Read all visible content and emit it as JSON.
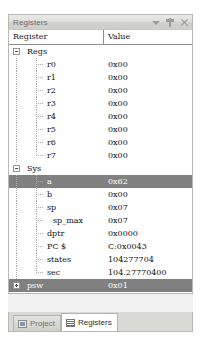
{
  "panel": {
    "title": "Registers",
    "title_icons": [
      {
        "name": "chevron-down-icon",
        "glyph": "caret"
      },
      {
        "name": "auto-hide-pin-icon",
        "glyph": "pin"
      },
      {
        "name": "close-icon",
        "glyph": "close"
      }
    ]
  },
  "grid": {
    "columns": [
      {
        "key": "register",
        "label": "Register"
      },
      {
        "key": "value",
        "label": "Value"
      }
    ],
    "rows": [
      {
        "name": "Regs",
        "value": "",
        "level": 0,
        "expander": "minus",
        "selected": false
      },
      {
        "name": "r0",
        "value": "0x00",
        "level": 1,
        "expander": "none",
        "selected": false
      },
      {
        "name": "r1",
        "value": "0x00",
        "level": 1,
        "expander": "none",
        "selected": false
      },
      {
        "name": "r2",
        "value": "0x00",
        "level": 1,
        "expander": "none",
        "selected": false
      },
      {
        "name": "r3",
        "value": "0x00",
        "level": 1,
        "expander": "none",
        "selected": false
      },
      {
        "name": "r4",
        "value": "0x00",
        "level": 1,
        "expander": "none",
        "selected": false
      },
      {
        "name": "r5",
        "value": "0x00",
        "level": 1,
        "expander": "none",
        "selected": false
      },
      {
        "name": "r6",
        "value": "0x00",
        "level": 1,
        "expander": "none",
        "selected": false
      },
      {
        "name": "r7",
        "value": "0x00",
        "level": 1,
        "expander": "none",
        "selected": false
      },
      {
        "name": "Sys",
        "value": "",
        "level": 0,
        "expander": "minus",
        "selected": false
      },
      {
        "name": "a",
        "value": "0x62",
        "level": 1,
        "expander": "none",
        "selected": true
      },
      {
        "name": "b",
        "value": "0x00",
        "level": 1,
        "expander": "none",
        "selected": false
      },
      {
        "name": "sp",
        "value": "0x07",
        "level": 1,
        "expander": "none",
        "selected": false
      },
      {
        "name": "sp_max",
        "value": "0x07",
        "level": 2,
        "expander": "none",
        "selected": false
      },
      {
        "name": "dptr",
        "value": "0x0000",
        "level": 1,
        "expander": "none",
        "selected": false
      },
      {
        "name": "PC $",
        "value": "C:0x0043",
        "level": 1,
        "expander": "none",
        "selected": false
      },
      {
        "name": "states",
        "value": "104277704",
        "level": 1,
        "expander": "none",
        "selected": false
      },
      {
        "name": "sec",
        "value": "104.27770400",
        "level": 1,
        "expander": "none",
        "selected": false
      },
      {
        "name": "psw",
        "value": "0x01",
        "level": 0,
        "expander": "plus",
        "selected": true
      }
    ]
  },
  "tabs": [
    {
      "label": "Project",
      "icon": "project",
      "active": false
    },
    {
      "label": "Registers",
      "icon": "registers",
      "active": true
    }
  ],
  "colors": {
    "selection": "#808080",
    "panel_border": "#b9b9b4",
    "titlebar": "#d8d8d4",
    "grid_background": "#ffffff"
  }
}
